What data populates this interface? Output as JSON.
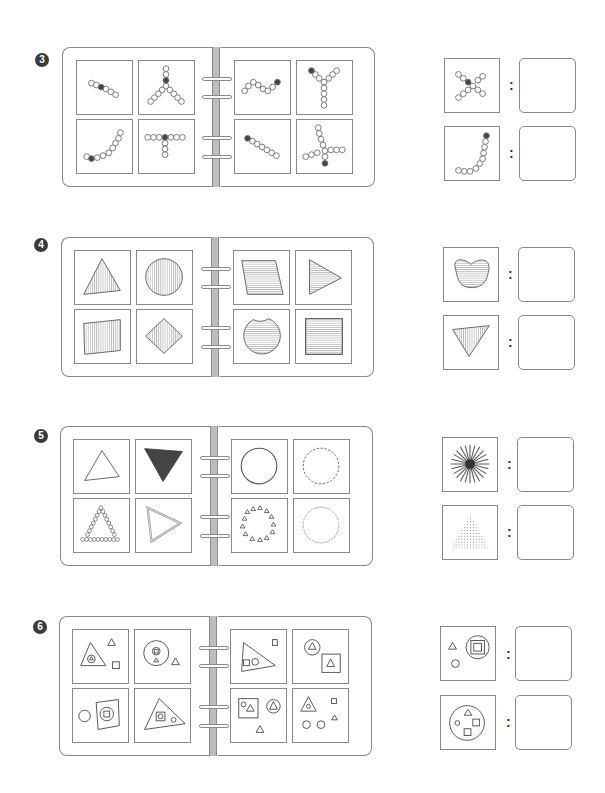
{
  "colors": {
    "line": "#8a8a8a",
    "fill_dark": "#444444",
    "spine": "#bdbdbd",
    "number_badge": "#3a3a3a"
  },
  "colon_label": ":",
  "sections": [
    {
      "number": "3",
      "theme": "bead-chains",
      "book_cells": [
        "short-diagonal-chain",
        "Y-chain-dark-center",
        "zigzag-chain-dark-end",
        "Y-chain-dark-top-left",
        "J-curve-chain",
        "T-chain-dark-center",
        "long-diagonal-chain-dark-start",
        "cross-chain-dark-bottom"
      ],
      "questions": [
        {
          "stimulus": "X-chain-dark-center",
          "answer": ""
        },
        {
          "stimulus": "J-chain-dark-top",
          "answer": ""
        }
      ]
    },
    {
      "number": "4",
      "theme": "striped-shapes",
      "book_cells": [
        "vertical-striped-triangle",
        "vertical-striped-circle",
        "horizontal-striped-parallelogram",
        "horizontal-striped-triangle",
        "vertical-striped-quadrilateral",
        "vertical-striped-diamond",
        "horizontal-striped-notched-circle",
        "horizontal-striped-square"
      ],
      "questions": [
        {
          "stimulus": "horizontal-striped-kidney",
          "answer": ""
        },
        {
          "stimulus": "vertical-striped-inverted-triangle",
          "answer": ""
        }
      ]
    },
    {
      "number": "5",
      "theme": "outline-styles",
      "book_cells": [
        "outline-triangle",
        "filled-inverted-triangle",
        "solid-circle",
        "dashed-circle",
        "bead-triangle",
        "double-line-triangle",
        "ring-of-small-triangles",
        "dotted-circle"
      ],
      "questions": [
        {
          "stimulus": "starburst",
          "answer": ""
        },
        {
          "stimulus": "dot-filled-triangle",
          "answer": ""
        }
      ]
    },
    {
      "number": "6",
      "theme": "nested-shapes",
      "book_cells": [
        "triangle-with-circle-and-small-shapes",
        "circle-with-square-and-triangle",
        "triangle-with-square-circle",
        "circle-triangle-and-square-triangle",
        "circle-and-square-with-circle-square",
        "triangle-with-square-circle-inside",
        "square-with-circle-triangle-and-circle-triangle",
        "triangle-circle-and-scattered-shapes"
      ],
      "questions": [
        {
          "stimulus": "circle-with-nested-squares",
          "answer": ""
        },
        {
          "stimulus": "circle-with-triangle-circle-squares",
          "answer": ""
        }
      ]
    }
  ]
}
